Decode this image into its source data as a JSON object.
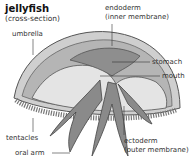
{
  "title": "jellyfish",
  "subtitle": "(cross-section)",
  "labels": {
    "umbrella": "umbrella",
    "endoderm": "endoderm",
    "endoderm_note": "(inner membrane)",
    "stomach": "stomach",
    "mouth": "mouth",
    "tentacles": "tentacles",
    "oral_arm": "oral arm",
    "ectoderm": "ectoderm",
    "ectoderm_note": "(outer membrane)"
  },
  "colors": {
    "outer": "#c8c8c8",
    "mid": "#9a9a9a",
    "inner": "#e2e2e2",
    "stroke": "#555555"
  }
}
